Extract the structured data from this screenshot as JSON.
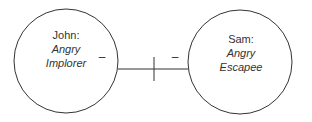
{
  "diagram": {
    "nodes": [
      {
        "name": "John:",
        "role_line1": "Angry",
        "role_line2": "Implorer"
      },
      {
        "name": "Sam:",
        "role_line1": "Angry",
        "role_line2": "Escapee"
      }
    ],
    "edge": {
      "left_sign": "–",
      "right_sign": "–",
      "type": "cut-off relationship"
    },
    "colors": {
      "stroke": "#333333",
      "text": "#333333"
    }
  }
}
